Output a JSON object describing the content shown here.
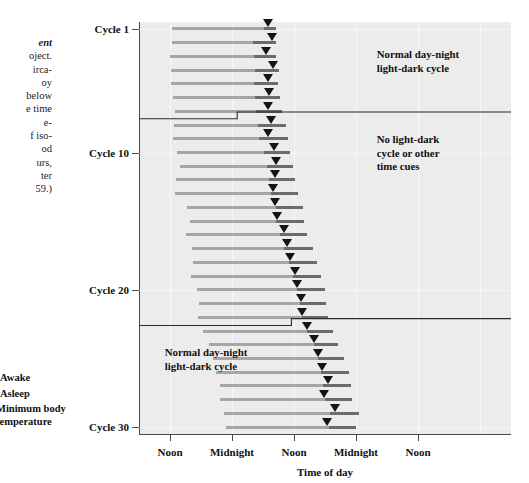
{
  "caption": {
    "lines": [
      "ent",
      "oject.",
      "irca-",
      "oy",
      "below",
      "e time",
      "e-",
      "f iso-",
      "od",
      "urs,",
      "ter",
      "59.)"
    ]
  },
  "legend": {
    "items": [
      {
        "label": "Awake",
        "swatch": "light-gray-bar"
      },
      {
        "label": "Asleep",
        "swatch": "dark-gray-bar"
      },
      {
        "label": "Minimum body\ntemperature",
        "swatch": "down-triangle"
      }
    ]
  },
  "axes": {
    "y_label_ticks": [
      "Cycle 1",
      "Cycle 10",
      "Cycle 20",
      "Cycle 30"
    ],
    "x_label_ticks": [
      "Noon",
      "Midnight",
      "Noon",
      "Midnight",
      "Noon"
    ],
    "x_title": "Time of day"
  },
  "annotations": {
    "top_region": "Normal day-night\nlight-dark cycle",
    "middle_region": "No light-dark\ncycle or other\ntime cues",
    "bottom_region": "Normal day-night\nlight-dark cycle"
  },
  "colors": {
    "plot_background": "#ececec",
    "awake_bar": "#a6a6a6",
    "asleep_bar": "#6b6b6b",
    "marker": "#141414",
    "axis": "#4a4a4a",
    "text": "#111111"
  },
  "chart_data": {
    "type": "bar",
    "title": "",
    "subtitle": "",
    "xlabel": "Time of day",
    "ylabel": "",
    "grid": true,
    "legend_position": "left-bottom",
    "xlim_hours": [
      6,
      78
    ],
    "x_tick_hours": [
      12,
      24,
      36,
      48,
      60
    ],
    "x_tick_labels": [
      "Noon",
      "Midnight",
      "Noon",
      "Midnight",
      "Noon"
    ],
    "ylim_cycles": [
      0.5,
      30.5
    ],
    "y_tick_cycles": [
      1,
      10,
      20,
      30
    ],
    "y_tick_labels": [
      "Cycle 1",
      "Cycle 10",
      "Cycle 20",
      "Cycle 30"
    ],
    "series_description": "Each horizontal bar is one sleep-wake cycle: light-gray = awake, dark-gray = asleep, down-triangle = minimum body temperature.",
    "light_regimen_regions": [
      {
        "label": "Normal day-night light-dark cycle",
        "cycles": [
          1,
          7
        ]
      },
      {
        "label": "No light-dark cycle or other time cues",
        "cycles": [
          8,
          22
        ]
      },
      {
        "label": "Normal day-night light-dark cycle",
        "cycles": [
          23,
          30
        ]
      }
    ],
    "cycles": [
      {
        "cycle": 1,
        "awake_start_h": 12.4,
        "asleep_start_h": 30.2,
        "end_h": 32.6,
        "temp_min_h": 30.9
      },
      {
        "cycle": 2,
        "awake_start_h": 12.4,
        "asleep_start_h": 28.0,
        "end_h": 32.6,
        "temp_min_h": 31.8
      },
      {
        "cycle": 3,
        "awake_start_h": 12.0,
        "asleep_start_h": 28.3,
        "end_h": 32.5,
        "temp_min_h": 30.5
      },
      {
        "cycle": 4,
        "awake_start_h": 12.2,
        "asleep_start_h": 28.4,
        "end_h": 33.1,
        "temp_min_h": 32.0
      },
      {
        "cycle": 5,
        "awake_start_h": 12.2,
        "asleep_start_h": 28.2,
        "end_h": 32.9,
        "temp_min_h": 30.9
      },
      {
        "cycle": 6,
        "awake_start_h": 12.6,
        "asleep_start_h": 28.5,
        "end_h": 33.3,
        "temp_min_h": 31.2
      },
      {
        "cycle": 7,
        "awake_start_h": 13.0,
        "asleep_start_h": 28.7,
        "end_h": 33.6,
        "temp_min_h": 30.9
      },
      {
        "cycle": 8,
        "awake_start_h": 12.8,
        "asleep_start_h": 29.0,
        "end_h": 34.4,
        "temp_min_h": 31.5
      },
      {
        "cycle": 9,
        "awake_start_h": 12.5,
        "asleep_start_h": 29.3,
        "end_h": 34.8,
        "temp_min_h": 31.0
      },
      {
        "cycle": 10,
        "awake_start_h": 13.4,
        "asleep_start_h": 30.2,
        "end_h": 35.3,
        "temp_min_h": 32.1
      },
      {
        "cycle": 11,
        "awake_start_h": 14.0,
        "asleep_start_h": 30.8,
        "end_h": 35.8,
        "temp_min_h": 32.6
      },
      {
        "cycle": 12,
        "awake_start_h": 13.2,
        "asleep_start_h": 31.2,
        "end_h": 36.2,
        "temp_min_h": 32.3
      },
      {
        "cycle": 13,
        "awake_start_h": 13.0,
        "asleep_start_h": 31.5,
        "end_h": 36.8,
        "temp_min_h": 32.0
      },
      {
        "cycle": 14,
        "awake_start_h": 15.2,
        "asleep_start_h": 32.5,
        "end_h": 37.8,
        "temp_min_h": 32.4
      },
      {
        "cycle": 15,
        "awake_start_h": 15.8,
        "asleep_start_h": 32.6,
        "end_h": 38.0,
        "temp_min_h": 32.7
      },
      {
        "cycle": 16,
        "awake_start_h": 15.0,
        "asleep_start_h": 33.2,
        "end_h": 38.6,
        "temp_min_h": 34.0
      },
      {
        "cycle": 17,
        "awake_start_h": 16.2,
        "asleep_start_h": 34.0,
        "end_h": 39.6,
        "temp_min_h": 34.7
      },
      {
        "cycle": 18,
        "awake_start_h": 16.5,
        "asleep_start_h": 35.0,
        "end_h": 40.4,
        "temp_min_h": 35.2
      },
      {
        "cycle": 19,
        "awake_start_h": 16.1,
        "asleep_start_h": 35.8,
        "end_h": 41.3,
        "temp_min_h": 36.1
      },
      {
        "cycle": 20,
        "awake_start_h": 17.2,
        "asleep_start_h": 36.6,
        "end_h": 42.0,
        "temp_min_h": 36.6
      },
      {
        "cycle": 21,
        "awake_start_h": 17.6,
        "asleep_start_h": 37.2,
        "end_h": 42.3,
        "temp_min_h": 37.3
      },
      {
        "cycle": 22,
        "awake_start_h": 17.4,
        "asleep_start_h": 37.6,
        "end_h": 42.6,
        "temp_min_h": 37.6
      },
      {
        "cycle": 23,
        "awake_start_h": 18.4,
        "asleep_start_h": 38.6,
        "end_h": 43.6,
        "temp_min_h": 38.6
      },
      {
        "cycle": 24,
        "awake_start_h": 19.6,
        "asleep_start_h": 39.8,
        "end_h": 44.6,
        "temp_min_h": 39.8
      },
      {
        "cycle": 25,
        "awake_start_h": 20.4,
        "asleep_start_h": 40.6,
        "end_h": 45.6,
        "temp_min_h": 40.6
      },
      {
        "cycle": 26,
        "awake_start_h": 20.8,
        "asleep_start_h": 41.2,
        "end_h": 46.6,
        "temp_min_h": 41.4
      },
      {
        "cycle": 27,
        "awake_start_h": 21.6,
        "asleep_start_h": 41.6,
        "end_h": 47.0,
        "temp_min_h": 42.6
      },
      {
        "cycle": 28,
        "awake_start_h": 21.6,
        "asleep_start_h": 42.0,
        "end_h": 47.2,
        "temp_min_h": 41.8
      },
      {
        "cycle": 29,
        "awake_start_h": 22.4,
        "asleep_start_h": 43.0,
        "end_h": 48.6,
        "temp_min_h": 44.0
      },
      {
        "cycle": 30,
        "awake_start_h": 22.8,
        "asleep_start_h": 42.8,
        "end_h": 48.0,
        "temp_min_h": 42.4
      }
    ]
  }
}
